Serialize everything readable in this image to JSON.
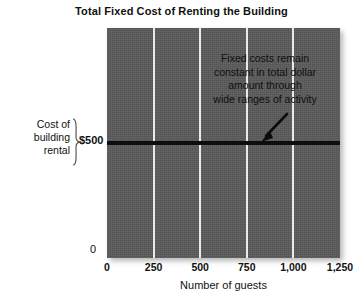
{
  "chart_data": {
    "type": "line",
    "title": "Total Fixed Cost of Renting the Building",
    "xlabel": "Number of guests",
    "ylabel": "",
    "xlim": [
      0,
      1250
    ],
    "ylim": [
      0,
      1000
    ],
    "grid": true,
    "legend": "none",
    "x_ticks": [
      {
        "value": 0,
        "label": "0"
      },
      {
        "value": 250,
        "label": "250"
      },
      {
        "value": 500,
        "label": "500"
      },
      {
        "value": 750,
        "label": "750"
      },
      {
        "value": 1000,
        "label": "1,000"
      },
      {
        "value": 1250,
        "label": "1,250"
      }
    ],
    "y_ticks": [
      {
        "value": 0,
        "label": "0"
      },
      {
        "value": 500,
        "label": "$500"
      }
    ],
    "series": [
      {
        "name": "Total fixed cost",
        "x": [
          0,
          250,
          500,
          750,
          1000,
          1250
        ],
        "values": [
          500,
          500,
          500,
          500,
          500,
          500
        ]
      }
    ],
    "annotations": [
      {
        "lines": [
          "Fixed costs remain",
          "constant in total dollar",
          "amount through",
          "wide ranges of activity"
        ],
        "arrow_points_to": {
          "x": 830,
          "y": 500
        }
      }
    ],
    "axis_group_label": {
      "lines": [
        "Cost of",
        "building",
        "rental"
      ],
      "brace_value": "$500"
    },
    "colors": {
      "plot_background": "#5a5a5a",
      "gridline": "#e9e9e6",
      "data_line": "#0d0d0d",
      "text": "#111111",
      "page_background": "#ffffff"
    }
  }
}
